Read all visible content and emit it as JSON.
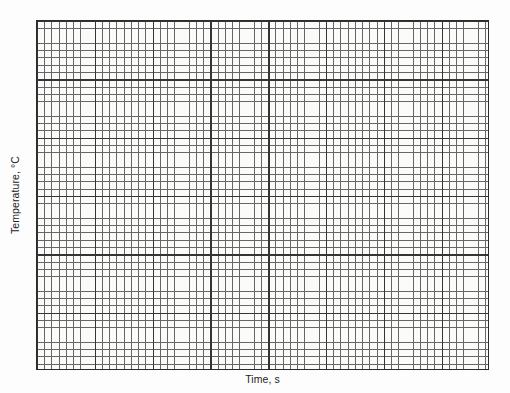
{
  "figure": {
    "kind": "blank-graph-paper-plot",
    "background_color": "#fdfdfd",
    "plot_background_color": "#fbfbfa",
    "border_color": "#2b2b2b",
    "minor_grid_color": "#555555",
    "major_grid_color": "#1f1f1f"
  },
  "axes": {
    "y": {
      "label": "Temperature, °C",
      "orientation": "vertical-rotated-90-ccw",
      "tick_labels": []
    },
    "x": {
      "label": "Time, s",
      "orientation": "horizontal",
      "tick_labels": []
    }
  },
  "chart_data": {
    "type": "line",
    "title": "",
    "subtitle": "",
    "xlabel": "Time, s",
    "ylabel": "Temperature, °C",
    "x": [],
    "series": [],
    "categories": [],
    "values": [],
    "annotations": [],
    "legend": {
      "entries": [],
      "position": "none"
    },
    "grid": {
      "enabled": true,
      "style": "graph-paper",
      "minor_cells_x": 62,
      "minor_cells_y": 48,
      "minor_spacing_px": 7.2,
      "major_every_n_minor": 8,
      "major_cells_x": 8,
      "major_cells_y": 6
    },
    "xlim": [],
    "ylim": [],
    "xticks": [],
    "yticks": [],
    "note": "Empty graph-paper grid; no data points, tick numbers, or legend are rendered in the image."
  }
}
